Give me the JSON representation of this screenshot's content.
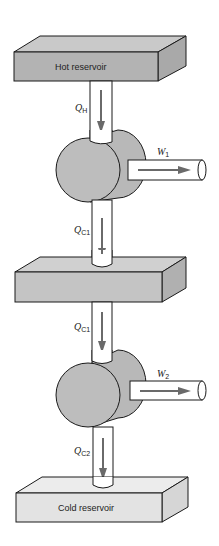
{
  "diagram": {
    "reservoirs": [
      {
        "id": "hot",
        "label": "Hot reservoir",
        "color": "#b3b3b3"
      },
      {
        "id": "middle",
        "label": "",
        "color": "#c4c4c4"
      },
      {
        "id": "cold",
        "label": "Cold reservoir",
        "color": "#e3e3e3"
      }
    ],
    "flows": [
      {
        "symbol": "Q",
        "subscript": "H"
      },
      {
        "symbol": "Q",
        "subscript": "C1"
      },
      {
        "symbol": "Q",
        "subscript": "C1"
      },
      {
        "symbol": "Q",
        "subscript": "C2"
      }
    ],
    "work_outputs": [
      {
        "symbol": "W",
        "subscript": "1"
      },
      {
        "symbol": "W",
        "subscript": "2"
      }
    ],
    "colors": {
      "engine": "#bdbdbd",
      "arrow": "#6a6a6a",
      "outline": "#1a1a1a",
      "pipe": "#ffffff"
    }
  }
}
